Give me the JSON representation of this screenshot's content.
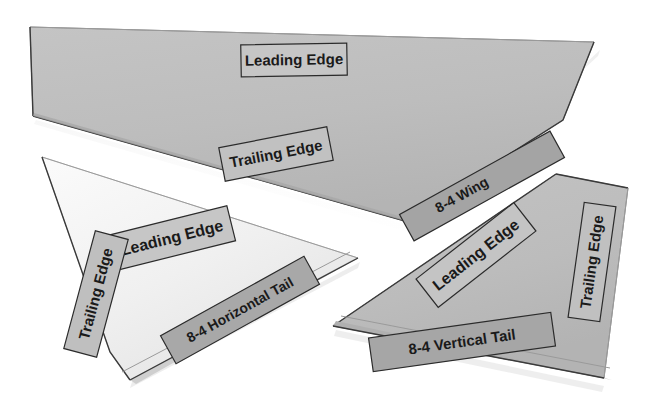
{
  "scene": {
    "title": "Model aircraft parts laid out on a white surface",
    "background_color": "#ffffff",
    "width": 663,
    "height": 411
  },
  "colors": {
    "wing_gray": "#bebebe",
    "wing_gray_shadow": "#b2b2b2",
    "tail_white": "#f2f2f2",
    "tail_white_shadow": "#e4e4e4",
    "vertical_gray": "#bdbdbd",
    "label_light": "#c9c9c9",
    "label_dark": "#a6a6a6",
    "label_border": "#2b2b2b",
    "text": "#1a1a1a",
    "edge_line": "#3a3a3a"
  },
  "parts": [
    {
      "id": "wing",
      "name": "8-4 Wing",
      "surface": "gray",
      "labels": [
        {
          "key": "leading_edge",
          "text": "Leading Edge",
          "rotation": -1,
          "style": "light"
        },
        {
          "key": "trailing_edge",
          "text": "Trailing Edge",
          "rotation": -11,
          "style": "light"
        },
        {
          "key": "part_name",
          "text": "8-4 Wing",
          "rotation": -29,
          "style": "dark"
        }
      ]
    },
    {
      "id": "horizontal-tail",
      "name": "8-4 Horizontal Tail",
      "surface": "white",
      "labels": [
        {
          "key": "leading_edge",
          "text": "Leading Edge",
          "rotation": -14,
          "style": "light"
        },
        {
          "key": "trailing_edge",
          "text": "Trailing Edge",
          "rotation": -75,
          "style": "light"
        },
        {
          "key": "part_name",
          "text": "8-4 Horizontal Tail",
          "rotation": -29,
          "style": "dark"
        }
      ]
    },
    {
      "id": "vertical-tail",
      "name": "8-4 Vertical Tail",
      "surface": "gray",
      "labels": [
        {
          "key": "leading_edge",
          "text": "Leading Edge",
          "rotation": -38,
          "style": "light"
        },
        {
          "key": "trailing_edge",
          "text": "Trailing Edge",
          "rotation": -82,
          "style": "light"
        },
        {
          "key": "part_name",
          "text": "8-4 Vertical Tail",
          "rotation": -8,
          "style": "dark"
        }
      ]
    }
  ],
  "labels_flat": {
    "wing_leading": "Leading Edge",
    "wing_trailing": "Trailing Edge",
    "wing_name": "8-4 Wing",
    "htail_leading": "Leading Edge",
    "htail_trailing": "Trailing Edge",
    "htail_name": "8-4 Horizontal Tail",
    "vtail_leading": "Leading Edge",
    "vtail_trailing": "Trailing Edge",
    "vtail_name": "8-4 Vertical Tail"
  }
}
